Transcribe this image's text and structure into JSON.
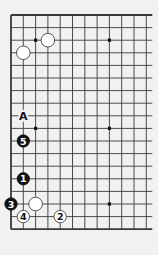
{
  "diagram": {
    "type": "go-board-fragment",
    "colors": {
      "background": "#f1f1f1",
      "line": "#3a3a3a",
      "black_stone": "#111111",
      "white_stone": "#ffffff",
      "white_stone_edge": "#555555"
    },
    "grid": {
      "columns": 12,
      "rows": 18,
      "origin_x": 11,
      "origin_y": 15,
      "spacing_x": 12.3,
      "spacing_y": 12.6,
      "edges": {
        "top": true,
        "bottom": true,
        "left": true,
        "right": false
      }
    },
    "star_points": [
      {
        "col": 3,
        "row": 3
      },
      {
        "col": 9,
        "row": 3
      },
      {
        "col": 3,
        "row": 10
      },
      {
        "col": 9,
        "row": 10
      },
      {
        "col": 9,
        "row": 16
      }
    ],
    "stones": [
      {
        "color": "white",
        "col": 2,
        "row": 4,
        "label": ""
      },
      {
        "color": "white",
        "col": 4,
        "row": 3,
        "label": ""
      },
      {
        "color": "black",
        "col": 2,
        "row": 11,
        "label": "5"
      },
      {
        "color": "black",
        "col": 2,
        "row": 14,
        "label": "1"
      },
      {
        "color": "black",
        "col": 1,
        "row": 16,
        "label": "3"
      },
      {
        "color": "white",
        "col": 3,
        "row": 16,
        "label": ""
      },
      {
        "color": "white",
        "col": 2,
        "row": 17,
        "label": "4"
      },
      {
        "color": "white",
        "col": 5,
        "row": 17,
        "label": "2"
      }
    ],
    "markers": [
      {
        "col": 2,
        "row": 9,
        "label": "A"
      }
    ]
  }
}
